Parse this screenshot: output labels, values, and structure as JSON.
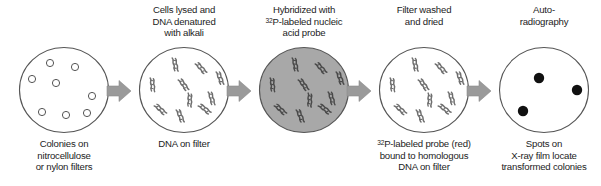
{
  "figure": {
    "width": 601,
    "height": 186,
    "background": "#ffffff"
  },
  "colors": {
    "outline": "#555555",
    "arrow_fill": "#9a9a9a",
    "arrow_stroke": "#8a8a8a",
    "dish_fill_white": "#ffffff",
    "dish_fill_gray": "#a8a8a8",
    "dna_white_panel": "#6f6f6f",
    "dna_gray_panel": "#4a4a4a",
    "spot_fill": "#111111",
    "text": "#1c1c1c"
  },
  "stages": [
    {
      "id": "colonies-on-filter",
      "index": 1,
      "left": 8,
      "width": 112,
      "top_caption": "",
      "bottom_caption_lines": [
        "Colonies on",
        "nitrocellulose",
        "or nylon filters"
      ],
      "dish": {
        "type": "open-circles",
        "fill": "#ffffff",
        "count": 8,
        "items": [
          {
            "cx": 30,
            "cy": 15,
            "r": 3.6
          },
          {
            "cx": 55,
            "cy": 19,
            "r": 3.6
          },
          {
            "cx": 12,
            "cy": 31,
            "r": 3.6
          },
          {
            "cx": 36,
            "cy": 35,
            "r": 3.6
          },
          {
            "cx": 72,
            "cy": 48,
            "r": 3.6
          },
          {
            "cx": 22,
            "cy": 64,
            "r": 3.6
          },
          {
            "cx": 46,
            "cy": 67,
            "r": 3.6
          },
          {
            "cx": 67,
            "cy": 65,
            "r": 3.6
          }
        ]
      }
    },
    {
      "id": "dna-on-filter",
      "index": 2,
      "left": 128,
      "width": 112,
      "top_caption_lines": [
        "Cells lysed and",
        "DNA denatured",
        "with alkali"
      ],
      "bottom_caption_lines": [
        "DNA on filter"
      ],
      "dish": {
        "type": "dna-squiggles",
        "fill": "#ffffff",
        "count": 10,
        "items": [
          {
            "x": 32,
            "y": 10,
            "rot": 18
          },
          {
            "x": 55,
            "y": 16,
            "rot": -12
          },
          {
            "x": 10,
            "y": 30,
            "rot": 24
          },
          {
            "x": 38,
            "y": 32,
            "rot": -6
          },
          {
            "x": 68,
            "y": 44,
            "rot": 14
          },
          {
            "x": 14,
            "y": 58,
            "rot": -18
          },
          {
            "x": 36,
            "y": 62,
            "rot": 8
          },
          {
            "x": 58,
            "y": 58,
            "rot": -22
          },
          {
            "x": 76,
            "y": 24,
            "rot": 10
          },
          {
            "x": 48,
            "y": 45,
            "rot": 30
          }
        ]
      }
    },
    {
      "id": "hybridized-filter",
      "index": 3,
      "left": 248,
      "width": 112,
      "top_caption_lines": [
        "Hybridized with",
        "32P-labeled nucleic",
        "acid probe"
      ],
      "top_caption_superscript": "32",
      "bottom_caption_lines": [],
      "dish": {
        "type": "dna-squiggles",
        "fill": "#a8a8a8",
        "count": 10,
        "items": [
          {
            "x": 32,
            "y": 10,
            "rot": 18
          },
          {
            "x": 55,
            "y": 16,
            "rot": -12
          },
          {
            "x": 10,
            "y": 30,
            "rot": 24
          },
          {
            "x": 38,
            "y": 32,
            "rot": -6
          },
          {
            "x": 68,
            "y": 44,
            "rot": 14
          },
          {
            "x": 14,
            "y": 58,
            "rot": -18
          },
          {
            "x": 36,
            "y": 62,
            "rot": 8
          },
          {
            "x": 58,
            "y": 58,
            "rot": -22
          },
          {
            "x": 76,
            "y": 24,
            "rot": 10
          },
          {
            "x": 48,
            "y": 45,
            "rot": 30
          }
        ]
      }
    },
    {
      "id": "washed-dried-filter",
      "index": 4,
      "left": 368,
      "width": 112,
      "top_caption_lines": [
        "Filter washed",
        "and dried"
      ],
      "bottom_caption_lines": [
        "32P-labeled probe (red)",
        "bound to homologous",
        "DNA on filter"
      ],
      "bottom_caption_superscript": "32",
      "dish": {
        "type": "dna-squiggles",
        "fill": "#ffffff",
        "count": 10,
        "items": [
          {
            "x": 32,
            "y": 10,
            "rot": 18
          },
          {
            "x": 55,
            "y": 16,
            "rot": -12
          },
          {
            "x": 10,
            "y": 30,
            "rot": 24
          },
          {
            "x": 38,
            "y": 32,
            "rot": -6
          },
          {
            "x": 68,
            "y": 44,
            "rot": 14
          },
          {
            "x": 14,
            "y": 58,
            "rot": -18
          },
          {
            "x": 36,
            "y": 62,
            "rot": 8
          },
          {
            "x": 58,
            "y": 58,
            "rot": -22
          },
          {
            "x": 76,
            "y": 24,
            "rot": 10
          },
          {
            "x": 48,
            "y": 45,
            "rot": 30
          }
        ]
      }
    },
    {
      "id": "autoradiograph-film",
      "index": 5,
      "left": 488,
      "width": 112,
      "top_caption_lines": [
        "Auto-",
        "radiography"
      ],
      "bottom_caption_lines": [
        "Spots on",
        "X-ray film locate",
        "transformed colonies"
      ],
      "dish": {
        "type": "black-spots",
        "fill": "#ffffff",
        "count": 3,
        "items": [
          {
            "cx": 39,
            "cy": 30,
            "r": 5.2
          },
          {
            "cx": 77,
            "cy": 42,
            "r": 5.2
          },
          {
            "cx": 23,
            "cy": 63,
            "r": 5.2
          }
        ]
      }
    }
  ],
  "arrows": [
    {
      "id": "arrow-1",
      "left": 106,
      "label": "step-arrow-1-to-2"
    },
    {
      "id": "arrow-2",
      "left": 226,
      "label": "step-arrow-2-to-3"
    },
    {
      "id": "arrow-3",
      "left": 346,
      "label": "step-arrow-3-to-4"
    },
    {
      "id": "arrow-4",
      "left": 466,
      "label": "step-arrow-4-to-5"
    }
  ]
}
